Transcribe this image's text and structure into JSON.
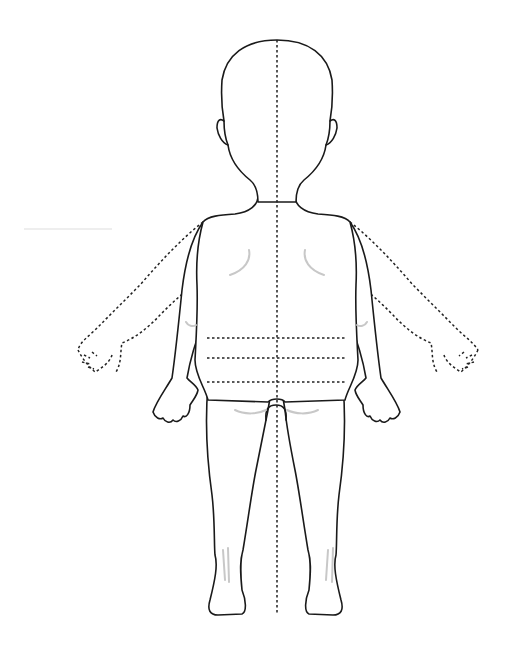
{
  "diagram": {
    "type": "body-outline",
    "view": "back",
    "colors": {
      "outline": "#1a1a1a",
      "dashed": "#222222",
      "shading": "#c8c8c8",
      "background": "#ffffff"
    },
    "guides": {
      "midline": "vertical dotted center line",
      "waist_lines": 3,
      "alternate_arm_position": "dotted raised arms"
    }
  }
}
